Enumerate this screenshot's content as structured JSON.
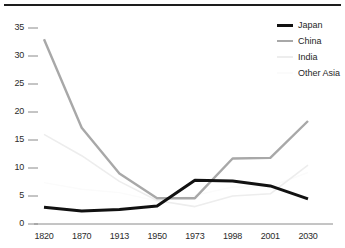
{
  "chart_data": {
    "type": "line",
    "title": "",
    "subtitle": "",
    "xlabel": "",
    "ylabel": "",
    "categories": [
      "1820",
      "1870",
      "1913",
      "1950",
      "1973",
      "1998",
      "2001",
      "2030"
    ],
    "ylim": [
      0,
      35
    ],
    "xlim_categories": [
      "1820",
      "2030"
    ],
    "yticks": [
      "0",
      "5",
      "10",
      "15",
      "20",
      "25",
      "30",
      "35"
    ],
    "grid": false,
    "legend_position": "top-right",
    "series": [
      {
        "name": "Japan",
        "color": "#111111",
        "width": 3.0,
        "values": [
          3.0,
          2.3,
          2.6,
          3.2,
          7.8,
          7.7,
          6.8,
          4.5
        ]
      },
      {
        "name": "China",
        "color": "#a8a8a8",
        "width": 2.4,
        "values": [
          33.0,
          17.2,
          9.0,
          4.6,
          4.6,
          11.7,
          11.8,
          18.4
        ]
      },
      {
        "name": "India",
        "color": "#ededed",
        "width": 1.6,
        "values": [
          16.0,
          12.2,
          7.6,
          4.2,
          3.1,
          5.0,
          5.4,
          10.5
        ]
      },
      {
        "name": "Other Asia",
        "color": "#fbfbfb",
        "width": 1.4,
        "values": [
          7.4,
          6.2,
          5.6,
          4.1,
          5.1,
          6.6,
          6.7,
          9.2
        ]
      }
    ]
  },
  "legend": {
    "items": [
      {
        "label": "Japan"
      },
      {
        "label": "China"
      },
      {
        "label": "India"
      },
      {
        "label": "Other Asia"
      }
    ]
  },
  "axis": {
    "y_tick_labels": [
      "35",
      "30",
      "25",
      "20",
      "15",
      "10",
      "5",
      "0"
    ],
    "x_tick_labels": [
      "1820",
      "1870",
      "1913",
      "1950",
      "1973",
      "1998",
      "2001",
      "2030"
    ]
  },
  "colors": {
    "axis": "#8a8a8a",
    "rule": "#1d1d1d",
    "text": "#2b2b2b",
    "japan": "#111111",
    "china": "#a8a8a8",
    "india": "#ededed",
    "other_asia": "#fbfbfb"
  }
}
